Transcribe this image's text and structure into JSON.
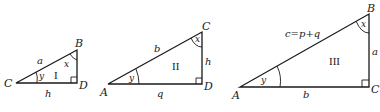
{
  "figure": {
    "triangles": [
      {
        "id": "I",
        "numeral": "I",
        "vertices": {
          "left": "C",
          "right_angle": "D",
          "top": "B"
        },
        "sides": {
          "hypotenuse": "a",
          "base": "h"
        },
        "angles": {
          "top": "x",
          "left": "y"
        }
      },
      {
        "id": "II",
        "numeral": "II",
        "vertices": {
          "left": "A",
          "right_angle": "D",
          "top": "C"
        },
        "sides": {
          "hypotenuse": "b",
          "base": "q",
          "vertical": "h"
        },
        "angles": {
          "top": "x",
          "left": "y"
        }
      },
      {
        "id": "III",
        "numeral": "III",
        "vertices": {
          "left": "A",
          "right_angle": "C",
          "top": "B"
        },
        "sides": {
          "hypotenuse": "c=p+q",
          "base": "b",
          "vertical": "a"
        },
        "angles": {
          "top": "x",
          "left": "y"
        }
      }
    ]
  }
}
